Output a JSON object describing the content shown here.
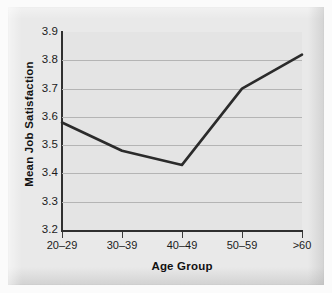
{
  "chart_data": {
    "type": "line",
    "title": "",
    "xlabel": "Age Group",
    "ylabel": "Mean Job Satisfaction",
    "categories": [
      "20–29",
      "30–39",
      "40–49",
      "50–59",
      ">60"
    ],
    "values": [
      3.58,
      3.48,
      3.43,
      3.7,
      3.82
    ],
    "series": [
      {
        "name": "Mean Job Satisfaction",
        "values": [
          3.58,
          3.48,
          3.43,
          3.7,
          3.82
        ]
      }
    ],
    "ylim": [
      3.2,
      3.9
    ],
    "ytick_labels": [
      "3.9",
      "3.8",
      "3.7",
      "3.6",
      "3.5",
      "3.4",
      "3.3",
      "3.2"
    ],
    "ytick_values": [
      3.9,
      3.8,
      3.7,
      3.6,
      3.5,
      3.4,
      3.3,
      3.2
    ],
    "gridline_values": [
      3.8,
      3.7,
      3.6,
      3.5,
      3.4,
      3.3
    ],
    "grid": true,
    "legend": false,
    "legend_position": "none",
    "line_color": "#2b2b2b",
    "panel_color": "#e4e4e4",
    "grid_color": "#b4b4b4",
    "axis_color": "#2f2f2f"
  }
}
